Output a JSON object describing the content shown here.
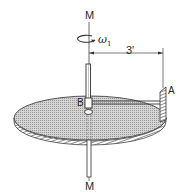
{
  "figure": {
    "type": "mechanics diagram",
    "labels": {
      "axis_top": "M",
      "axis_bottom": "M",
      "angular_velocity": "ω",
      "angular_velocity_subscript": "1",
      "dimension": "3′",
      "point_a": "A",
      "point_b": "B"
    },
    "colors": {
      "line": "#333333",
      "disk_fill": "#bdbdbd",
      "rim": "#555555"
    }
  }
}
